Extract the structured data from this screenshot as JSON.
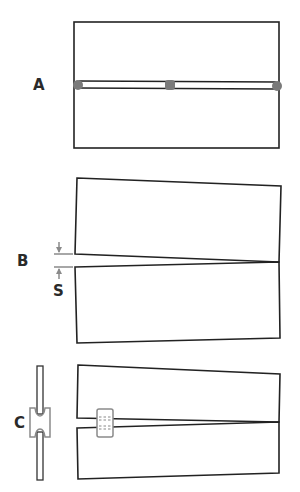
{
  "figure": {
    "panels": [
      {
        "label": "A",
        "description": "Rectangular plate with horizontal slot joined by three spot welds"
      },
      {
        "label": "B",
        "description": "Two halves separated at left end by gap S, converging to a point at right"
      },
      {
        "label": "C",
        "description": "Two halves held apart by an H-shaped spacer clip, side view at left"
      }
    ],
    "gap_label": "S",
    "colors": {
      "outline": "#222222",
      "clip": "#8a8a8a",
      "weld_dot": "#7a7a7a",
      "background": "#ffffff"
    }
  }
}
